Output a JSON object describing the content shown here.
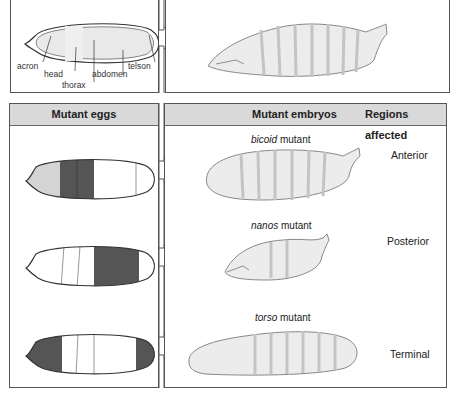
{
  "wildtype": {
    "egg_labels": [
      "acron",
      "head",
      "thorax",
      "abdomen",
      "telson"
    ]
  },
  "mutant_panel": {
    "left_header": "Mutant eggs",
    "middle_header": "Mutant embryos",
    "right_header": "Regions affected",
    "rows": [
      {
        "gene": "bicoid",
        "suffix": "mutant",
        "region": "Anterior",
        "egg_shading": "anterior (head+thorax dark, acron pale)"
      },
      {
        "gene": "nanos",
        "suffix": "mutant",
        "region": "Posterior",
        "egg_shading": "posterior (abdomen dark)"
      },
      {
        "gene": "torso",
        "suffix": "mutant",
        "region": "Terminal",
        "egg_shading": "terminal (acron and telson dark)"
      }
    ]
  },
  "colors": {
    "header_fill": "#d9d9d9",
    "dark_band": "#555555",
    "pale_band": "#d4d4d4",
    "border": "#555555"
  }
}
